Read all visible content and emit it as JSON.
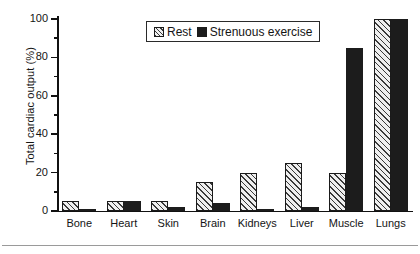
{
  "chart_data": {
    "type": "bar",
    "title": "",
    "xlabel": "",
    "ylabel": "Total cardiac output (%)",
    "ylim": [
      0,
      100
    ],
    "yticks": [
      0,
      20,
      40,
      60,
      80,
      100
    ],
    "ytick_labels": [
      "0",
      "20",
      "40",
      "60",
      "80",
      "100"
    ],
    "grid": false,
    "legend_position": "top-center",
    "categories": [
      "Bone",
      "Heart",
      "Skin",
      "Brain",
      "Kidneys",
      "Liver",
      "Muscle",
      "Lungs"
    ],
    "series": [
      {
        "name": "Rest",
        "pattern": "hatched",
        "color": "#efefef",
        "values": [
          5,
          5,
          5,
          15,
          20,
          25,
          20,
          100
        ]
      },
      {
        "name": "Strenuous exercise",
        "pattern": "solid",
        "color": "#1c1c1c",
        "values": [
          1,
          5,
          2,
          4,
          1,
          2,
          85,
          100
        ]
      }
    ]
  },
  "legend": {
    "entries": [
      {
        "label": "Rest"
      },
      {
        "label": "Strenuous exercise"
      }
    ]
  },
  "axes": {
    "y_title": "Total cardiac output (%)"
  }
}
